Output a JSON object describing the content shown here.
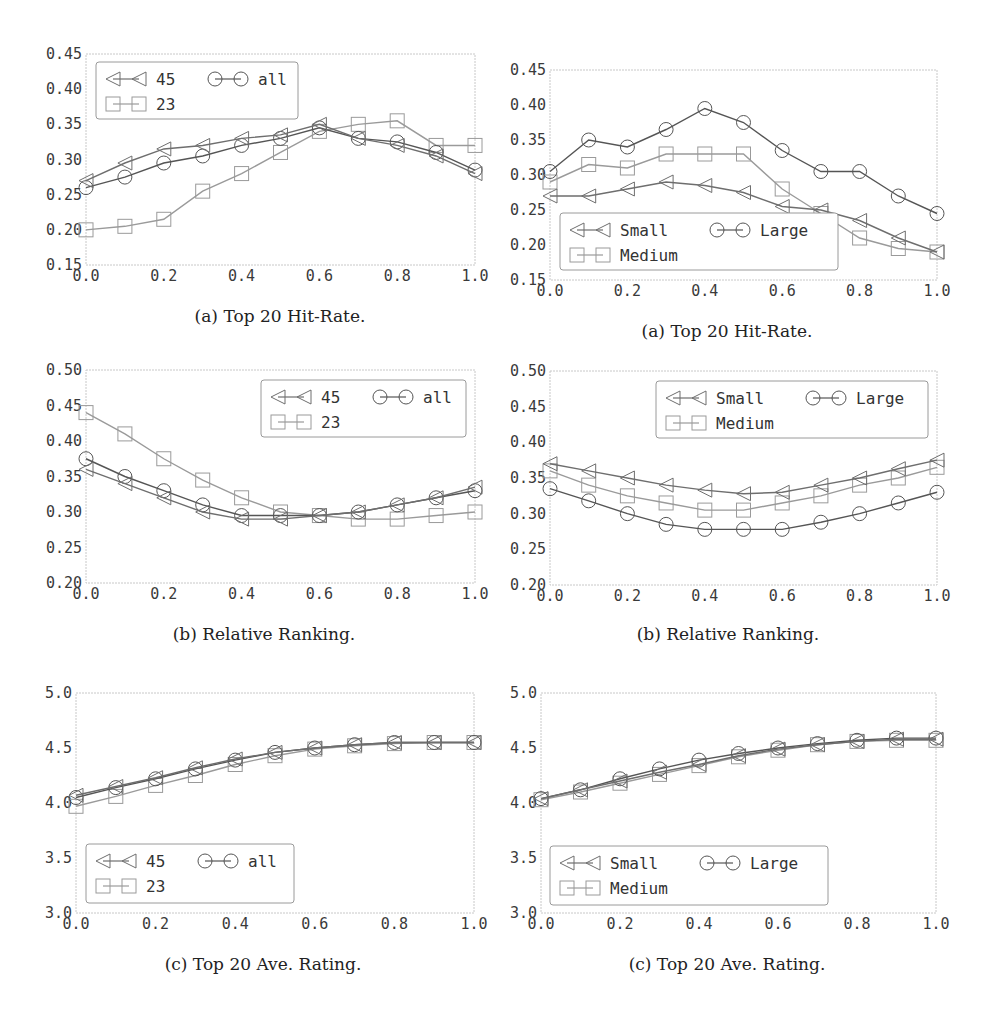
{
  "figure": {
    "panels": [
      {
        "id": "tl",
        "caption": "(a) Top 20 Hit-Rate."
      },
      {
        "id": "tr",
        "caption": "(a) Top 20 Hit-Rate."
      },
      {
        "id": "ml",
        "caption": "(b) Relative Ranking."
      },
      {
        "id": "mr",
        "caption": "(b) Relative Ranking."
      },
      {
        "id": "bl",
        "caption": "(c) Top 20 Ave. Rating."
      },
      {
        "id": "br",
        "caption": "(c) Top 20 Ave. Rating."
      }
    ]
  },
  "chart_data": [
    {
      "id": "tl",
      "type": "line",
      "title": "(a) Top 20 Hit-Rate.",
      "xlabel": "",
      "ylabel": "",
      "x": [
        0.0,
        0.1,
        0.2,
        0.3,
        0.4,
        0.5,
        0.6,
        0.7,
        0.8,
        0.9,
        1.0
      ],
      "xticks": [
        "0.0",
        "0.2",
        "0.4",
        "0.6",
        "0.8",
        "1.0"
      ],
      "yticks": [
        "0.15",
        "0.20",
        "0.25",
        "0.30",
        "0.35",
        "0.40",
        "0.45"
      ],
      "xlim": [
        0.0,
        1.0
      ],
      "ylim": [
        0.15,
        0.45
      ],
      "grid": false,
      "legend_position": "upper left",
      "series": [
        {
          "name": "45",
          "marker": "triangle-left",
          "color": "#6e6e6e",
          "values": [
            0.27,
            0.295,
            0.315,
            0.32,
            0.33,
            0.335,
            0.35,
            0.33,
            0.32,
            0.305,
            0.28
          ]
        },
        {
          "name": "all",
          "marker": "circle",
          "color": "#555555",
          "values": [
            0.26,
            0.275,
            0.295,
            0.305,
            0.32,
            0.33,
            0.345,
            0.33,
            0.325,
            0.31,
            0.285
          ]
        },
        {
          "name": "23",
          "marker": "square",
          "color": "#9a9a9a",
          "values": [
            0.2,
            0.205,
            0.215,
            0.255,
            0.28,
            0.31,
            0.34,
            0.35,
            0.355,
            0.32,
            0.32
          ]
        }
      ]
    },
    {
      "id": "tr",
      "type": "line",
      "title": "(a) Top 20 Hit-Rate.",
      "xlabel": "",
      "ylabel": "",
      "x": [
        0.0,
        0.1,
        0.2,
        0.3,
        0.4,
        0.5,
        0.6,
        0.7,
        0.8,
        0.9,
        1.0
      ],
      "xticks": [
        "0.0",
        "0.2",
        "0.4",
        "0.6",
        "0.8",
        "1.0"
      ],
      "yticks": [
        "0.15",
        "0.20",
        "0.25",
        "0.30",
        "0.35",
        "0.40",
        "0.45"
      ],
      "xlim": [
        0.0,
        1.0
      ],
      "ylim": [
        0.15,
        0.45
      ],
      "grid": false,
      "legend_position": "lower left",
      "series": [
        {
          "name": "Small",
          "marker": "triangle-left",
          "color": "#6e6e6e",
          "values": [
            0.27,
            0.27,
            0.28,
            0.29,
            0.285,
            0.275,
            0.255,
            0.25,
            0.235,
            0.21,
            0.19
          ]
        },
        {
          "name": "Large",
          "marker": "circle",
          "color": "#555555",
          "values": [
            0.305,
            0.35,
            0.34,
            0.365,
            0.395,
            0.375,
            0.335,
            0.305,
            0.305,
            0.27,
            0.245
          ]
        },
        {
          "name": "Medium",
          "marker": "square",
          "color": "#9a9a9a",
          "values": [
            0.29,
            0.315,
            0.31,
            0.33,
            0.33,
            0.33,
            0.28,
            0.245,
            0.21,
            0.195,
            0.19
          ]
        }
      ]
    },
    {
      "id": "ml",
      "type": "line",
      "title": "(b) Relative Ranking.",
      "xlabel": "",
      "ylabel": "",
      "x": [
        0.0,
        0.1,
        0.2,
        0.3,
        0.4,
        0.5,
        0.6,
        0.7,
        0.8,
        0.9,
        1.0
      ],
      "xticks": [
        "0.0",
        "0.2",
        "0.4",
        "0.6",
        "0.8",
        "1.0"
      ],
      "yticks": [
        "0.20",
        "0.25",
        "0.30",
        "0.35",
        "0.40",
        "0.45",
        "0.50"
      ],
      "xlim": [
        0.0,
        1.0
      ],
      "ylim": [
        0.2,
        0.5
      ],
      "grid": false,
      "legend_position": "upper right",
      "series": [
        {
          "name": "45",
          "marker": "triangle-left",
          "color": "#6e6e6e",
          "values": [
            0.36,
            0.34,
            0.32,
            0.3,
            0.29,
            0.29,
            0.295,
            0.3,
            0.31,
            0.32,
            0.335
          ]
        },
        {
          "name": "all",
          "marker": "circle",
          "color": "#555555",
          "values": [
            0.375,
            0.35,
            0.33,
            0.31,
            0.295,
            0.295,
            0.295,
            0.3,
            0.31,
            0.32,
            0.33
          ]
        },
        {
          "name": "23",
          "marker": "square",
          "color": "#9a9a9a",
          "values": [
            0.44,
            0.41,
            0.375,
            0.345,
            0.32,
            0.3,
            0.295,
            0.29,
            0.29,
            0.295,
            0.3
          ]
        }
      ]
    },
    {
      "id": "mr",
      "type": "line",
      "title": "(b) Relative Ranking.",
      "xlabel": "",
      "ylabel": "",
      "x": [
        0.0,
        0.1,
        0.2,
        0.3,
        0.4,
        0.5,
        0.6,
        0.7,
        0.8,
        0.9,
        1.0
      ],
      "xticks": [
        "0.0",
        "0.2",
        "0.4",
        "0.6",
        "0.8",
        "1.0"
      ],
      "yticks": [
        "0.20",
        "0.25",
        "0.30",
        "0.35",
        "0.40",
        "0.45",
        "0.50"
      ],
      "xlim": [
        0.0,
        1.0
      ],
      "ylim": [
        0.2,
        0.5
      ],
      "grid": false,
      "legend_position": "upper right",
      "series": [
        {
          "name": "Small",
          "marker": "triangle-left",
          "color": "#6e6e6e",
          "values": [
            0.37,
            0.36,
            0.35,
            0.34,
            0.333,
            0.328,
            0.33,
            0.34,
            0.35,
            0.363,
            0.375
          ]
        },
        {
          "name": "Large",
          "marker": "circle",
          "color": "#555555",
          "values": [
            0.335,
            0.318,
            0.3,
            0.285,
            0.278,
            0.278,
            0.278,
            0.288,
            0.3,
            0.315,
            0.33
          ]
        },
        {
          "name": "Medium",
          "marker": "square",
          "color": "#9a9a9a",
          "values": [
            0.36,
            0.34,
            0.325,
            0.315,
            0.305,
            0.305,
            0.315,
            0.325,
            0.34,
            0.35,
            0.365
          ]
        }
      ]
    },
    {
      "id": "bl",
      "type": "line",
      "title": "(c) Top 20 Ave. Rating.",
      "xlabel": "",
      "ylabel": "",
      "x": [
        0.0,
        0.1,
        0.2,
        0.3,
        0.4,
        0.5,
        0.6,
        0.7,
        0.8,
        0.9,
        1.0
      ],
      "xticks": [
        "0.0",
        "0.2",
        "0.4",
        "0.6",
        "0.8",
        "1.0"
      ],
      "yticks": [
        "3.0",
        "3.5",
        "4.0",
        "4.5",
        "5.0"
      ],
      "xlim": [
        0.0,
        1.0
      ],
      "ylim": [
        3.0,
        5.0
      ],
      "grid": false,
      "legend_position": "lower left",
      "series": [
        {
          "name": "45",
          "marker": "triangle-left",
          "color": "#6e6e6e",
          "values": [
            4.07,
            4.15,
            4.23,
            4.32,
            4.4,
            4.46,
            4.5,
            4.53,
            4.55,
            4.55,
            4.55
          ]
        },
        {
          "name": "all",
          "marker": "circle",
          "color": "#555555",
          "values": [
            4.05,
            4.14,
            4.22,
            4.31,
            4.39,
            4.46,
            4.5,
            4.53,
            4.55,
            4.55,
            4.55
          ]
        },
        {
          "name": "23",
          "marker": "square",
          "color": "#9a9a9a",
          "values": [
            3.97,
            4.06,
            4.16,
            4.25,
            4.35,
            4.43,
            4.49,
            4.52,
            4.54,
            4.55,
            4.55
          ]
        }
      ]
    },
    {
      "id": "br",
      "type": "line",
      "title": "(c) Top 20 Ave. Rating.",
      "xlabel": "",
      "ylabel": "",
      "x": [
        0.0,
        0.1,
        0.2,
        0.3,
        0.4,
        0.5,
        0.6,
        0.7,
        0.8,
        0.9,
        1.0
      ],
      "xticks": [
        "0.0",
        "0.2",
        "0.4",
        "0.6",
        "0.8",
        "1.0"
      ],
      "yticks": [
        "3.0",
        "3.5",
        "4.0",
        "4.5",
        "5.0"
      ],
      "xlim": [
        0.0,
        1.0
      ],
      "ylim": [
        3.0,
        5.0
      ],
      "grid": false,
      "legend_position": "lower left",
      "series": [
        {
          "name": "Small",
          "marker": "triangle-left",
          "color": "#6e6e6e",
          "values": [
            4.04,
            4.12,
            4.2,
            4.28,
            4.35,
            4.43,
            4.49,
            4.53,
            4.56,
            4.58,
            4.58
          ]
        },
        {
          "name": "Large",
          "marker": "circle",
          "color": "#555555",
          "values": [
            4.04,
            4.12,
            4.22,
            4.31,
            4.39,
            4.45,
            4.5,
            4.54,
            4.57,
            4.59,
            4.59
          ]
        },
        {
          "name": "Medium",
          "marker": "square",
          "color": "#9a9a9a",
          "values": [
            4.03,
            4.1,
            4.18,
            4.26,
            4.34,
            4.42,
            4.48,
            4.53,
            4.56,
            4.57,
            4.57
          ]
        }
      ]
    }
  ]
}
